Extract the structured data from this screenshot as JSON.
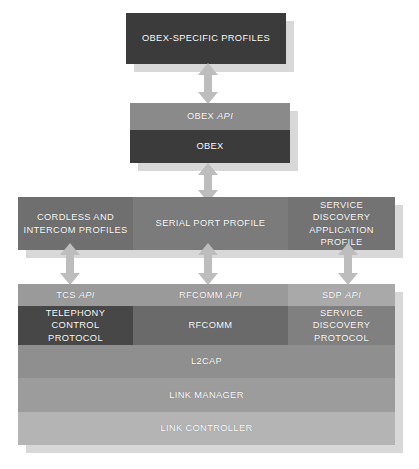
{
  "diagram": {
    "palette": {
      "darkest": "#3b3b3b",
      "dark": "#474747",
      "mid": "#6f6f6f",
      "api_band": "#9a9a9a",
      "l2cap": "#8f8f8f",
      "link_manager": "#9c9c9c",
      "link_controller": "#b4b4b4",
      "arrow": "#bdbdbd",
      "shadow": "#d8d8d8",
      "text": "#ffffff",
      "background": "#ffffff"
    },
    "blocks": {
      "obex_specific_profiles": "OBEX-SPECIFIC PROFILES",
      "obex_api": "OBEX API",
      "obex_api_plain": "OBEX",
      "obex_api_italic": "API",
      "obex": "OBEX",
      "cordless_and_intercom_profiles_line1": "CORDLESS AND",
      "cordless_and_intercom_profiles_line2": "INTERCOM PROFILES",
      "serial_port_profile": "SERIAL PORT PROFILE",
      "service_discovery_application_profile_line1": "SERVICE DISCOVERY",
      "service_discovery_application_profile_line2": "APPLICATION PROFILE",
      "tcs_api_plain": "TCS",
      "tcs_api_italic": "API",
      "rfcomm_api_plain": "RFCOMM",
      "rfcomm_api_italic": "API",
      "sdp_api_plain": "SDP",
      "sdp_api_italic": "API",
      "telephony_control_protocol_line1": "TELEPHONY CONTROL",
      "telephony_control_protocol_line2": "PROTOCOL",
      "rfcomm": "RFCOMM",
      "service_discovery_protocol_line1": "SERVICE DISCOVERY",
      "service_discovery_protocol_line2": "PROTOCOL",
      "l2cap": "L2CAP",
      "link_manager": "LINK MANAGER",
      "link_controller": "LINK CONTROLLER"
    },
    "arrows": {
      "obex_profiles_to_obex_api": "double-headed-vertical-arrow",
      "obex_to_serial_port_profile": "double-headed-vertical-arrow",
      "cordless_profiles_to_tcs_api": "double-headed-vertical-arrow",
      "serial_port_profile_to_rfcomm_api": "double-headed-vertical-arrow",
      "sdap_to_sdp_api": "double-headed-vertical-arrow"
    }
  }
}
